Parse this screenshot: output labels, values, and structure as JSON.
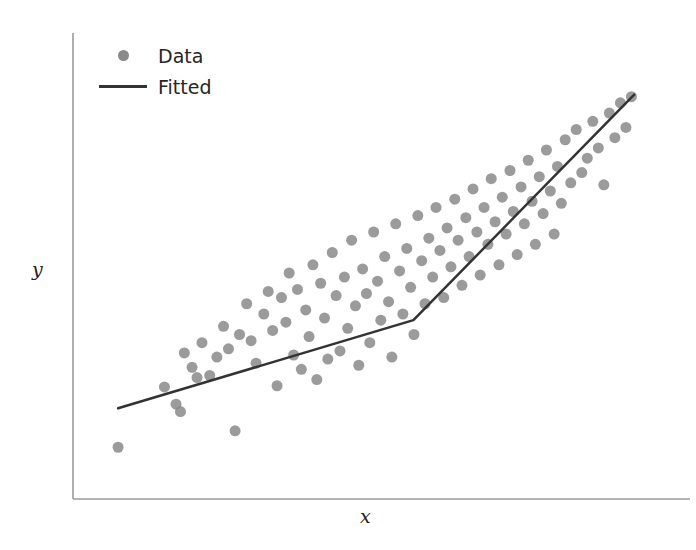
{
  "chart_data": {
    "type": "scatter",
    "title": "",
    "xlabel": "x",
    "ylabel": "y",
    "grid": false,
    "legend_position": "upper left",
    "xlim": [
      0,
      100
    ],
    "ylim": [
      0,
      100
    ],
    "axes": {
      "spines": [
        "left",
        "bottom"
      ],
      "ticks": [],
      "xticklabels": [],
      "yticklabels": []
    },
    "legend": {
      "entries": [
        {
          "label": "Data",
          "marker": "circle",
          "color": "#8a8a8a"
        },
        {
          "label": "Fitted",
          "marker": "line",
          "color": "#333333"
        }
      ]
    },
    "series": [
      {
        "name": "Data",
        "type": "scatter",
        "color": "#8a8a8a",
        "marker_size": 11,
        "x": [
          4.0,
          12.4,
          14.5,
          15.3,
          16.0,
          17.4,
          18.3,
          19.2,
          20.6,
          21.9,
          23.1,
          24.0,
          25.2,
          26.0,
          27.3,
          28.1,
          29.0,
          30.4,
          31.2,
          32.0,
          32.8,
          33.6,
          34.4,
          35.0,
          35.8,
          36.5,
          37.2,
          38.0,
          38.6,
          39.3,
          40.0,
          40.7,
          41.4,
          42.0,
          42.8,
          43.5,
          44.2,
          45.0,
          45.6,
          46.3,
          47.0,
          47.6,
          48.3,
          49.0,
          49.6,
          50.3,
          51.0,
          51.6,
          52.3,
          53.0,
          53.6,
          54.3,
          55.0,
          55.6,
          56.3,
          57.0,
          57.6,
          58.3,
          59.0,
          59.6,
          60.3,
          61.0,
          61.6,
          62.3,
          63.0,
          63.6,
          64.3,
          65.0,
          65.6,
          66.3,
          67.0,
          67.6,
          68.3,
          69.0,
          69.6,
          70.3,
          71.0,
          71.6,
          72.3,
          73.0,
          73.6,
          74.3,
          75.0,
          75.6,
          76.3,
          77.0,
          77.6,
          78.3,
          79.0,
          79.6,
          80.3,
          81.0,
          81.6,
          82.3,
          83.0,
          83.6,
          84.3,
          85.0,
          86.0,
          87.0,
          88.0,
          89.0,
          90.0,
          91.0,
          92.0,
          93.0,
          94.0,
          95.0,
          96.0,
          97.0
        ],
        "y": [
          7.5,
          22.2,
          18.0,
          16.2,
          30.5,
          27.0,
          24.5,
          33.0,
          25.0,
          29.5,
          37.0,
          31.5,
          11.5,
          35.0,
          42.5,
          33.5,
          28.0,
          40.0,
          45.5,
          36.0,
          22.5,
          44.0,
          38.0,
          50.0,
          30.0,
          46.0,
          26.5,
          41.0,
          34.5,
          52.0,
          24.0,
          47.5,
          39.0,
          29.0,
          55.0,
          44.5,
          31.0,
          49.0,
          36.5,
          58.0,
          42.0,
          27.5,
          51.0,
          45.0,
          33.0,
          60.0,
          48.0,
          38.5,
          54.0,
          43.0,
          29.5,
          62.0,
          50.5,
          40.0,
          56.0,
          46.5,
          35.0,
          64.0,
          53.0,
          42.5,
          58.5,
          49.0,
          66.0,
          55.5,
          44.0,
          61.0,
          51.5,
          68.0,
          58.0,
          47.0,
          63.5,
          54.0,
          70.5,
          60.0,
          49.5,
          66.0,
          57.0,
          73.0,
          62.5,
          52.0,
          68.5,
          59.5,
          75.0,
          65.0,
          54.5,
          71.0,
          62.0,
          77.5,
          67.5,
          57.0,
          73.5,
          64.5,
          80.0,
          70.0,
          59.5,
          76.0,
          67.0,
          82.5,
          72.0,
          85.0,
          74.5,
          78.0,
          87.0,
          80.5,
          71.5,
          89.0,
          83.0,
          91.5,
          85.5,
          93.0
        ]
      },
      {
        "name": "Fitted",
        "type": "line",
        "color": "#333333",
        "linewidth": 2.5,
        "breakpoint_x": 57.5,
        "x": [
          4.0,
          57.5,
          97.5
        ],
        "y": [
          17.0,
          38.5,
          93.5
        ]
      }
    ]
  }
}
